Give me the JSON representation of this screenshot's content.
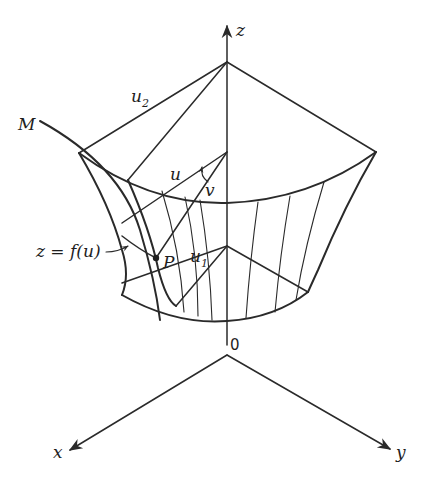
{
  "figure": {
    "axes": {
      "z_label": "z",
      "x_label": "x",
      "y_label": "y",
      "origin_label": "0"
    },
    "labels": {
      "curve": "M",
      "u2_main": "u",
      "u2_sub": "2",
      "u1_main": "u",
      "u1_sub": "1",
      "u": "u",
      "v": "v",
      "point": "P",
      "equation": "z = f(u)"
    },
    "colors": {
      "stroke": "#2a2a2a",
      "background": "#ffffff"
    }
  }
}
